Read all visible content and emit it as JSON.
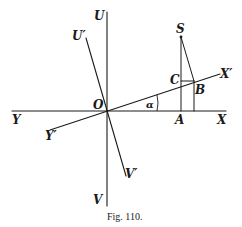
{
  "figure": {
    "caption": "Fig. 110.",
    "labels": {
      "U": "U",
      "U_prime": "U′",
      "V": "V",
      "V_prime": "V′",
      "X": "X",
      "X_prime": "X′",
      "Y": "Y",
      "Y_prime": "Y′",
      "O": "O",
      "S": "S",
      "A": "A",
      "B": "B",
      "C": "C",
      "alpha": "α"
    },
    "colors": {
      "ink": "#1a1a1a",
      "background": "#ffffff"
    }
  }
}
